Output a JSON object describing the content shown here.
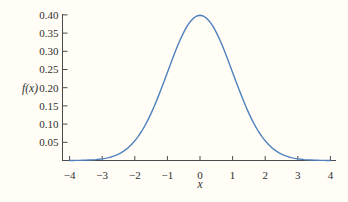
{
  "chart_data": {
    "type": "line",
    "title": "",
    "xlabel": "x",
    "ylabel": "f(x)",
    "xlim": [
      -4.2,
      4.2
    ],
    "ylim": [
      0,
      0.405
    ],
    "grid": false,
    "legend": "none",
    "x_ticks": [
      -4,
      -3,
      -2,
      -1,
      0,
      1,
      2,
      3,
      4
    ],
    "x_tick_labels": [
      "−4",
      "−3",
      "−2",
      "−1",
      "0",
      "1",
      "2",
      "3",
      "4"
    ],
    "y_ticks": [
      0.05,
      0.1,
      0.15,
      0.2,
      0.25,
      0.3,
      0.35,
      0.4
    ],
    "y_tick_labels": [
      "0.05",
      "0.10",
      "0.15",
      "0.20",
      "0.25",
      "0.30",
      "0.35",
      "0.40"
    ],
    "series": [
      {
        "name": "standard-normal-pdf",
        "formula": "f(x) = exp(-x^2/2) / sqrt(2*pi)",
        "peak": {
          "x": 0,
          "y": 0.3989
        },
        "sampling": {
          "x_start": 0,
          "x_end": 4,
          "x_step": 0.1,
          "symmetric_about_x0": true
        },
        "values_x0_to_4": [
          0.3989,
          0.397,
          0.391,
          0.3814,
          0.3683,
          0.3521,
          0.3332,
          0.3123,
          0.2897,
          0.2661,
          0.242,
          0.2179,
          0.1942,
          0.1714,
          0.1497,
          0.1295,
          0.1109,
          0.094,
          0.079,
          0.0656,
          0.054,
          0.044,
          0.0355,
          0.0283,
          0.0224,
          0.0175,
          0.0136,
          0.0104,
          0.0079,
          0.006,
          0.0044,
          0.0033,
          0.0024,
          0.0017,
          0.0012,
          0.0009,
          0.0006,
          0.0004,
          0.0003,
          0.0002,
          0.0001
        ]
      }
    ],
    "colors": {
      "curve": "#4f81bd",
      "axis": "#4a4a4a",
      "text": "#2f2f2f",
      "background": "#fffdf5"
    }
  }
}
